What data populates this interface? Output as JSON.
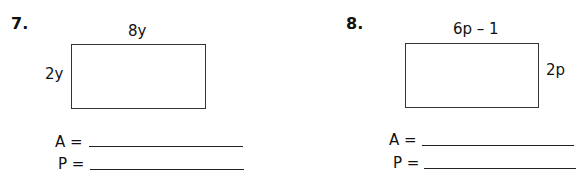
{
  "problems": [
    {
      "number": "7.",
      "top_label": "8y",
      "side_label": "2y",
      "area_label": "A =",
      "perimeter_label": "P =",
      "area_answer": "",
      "perimeter_answer": ""
    },
    {
      "number": "8.",
      "top_label": "6p – 1",
      "side_label": "2p",
      "area_label": "A =",
      "perimeter_label": "P =",
      "area_answer": "",
      "perimeter_answer": ""
    }
  ]
}
